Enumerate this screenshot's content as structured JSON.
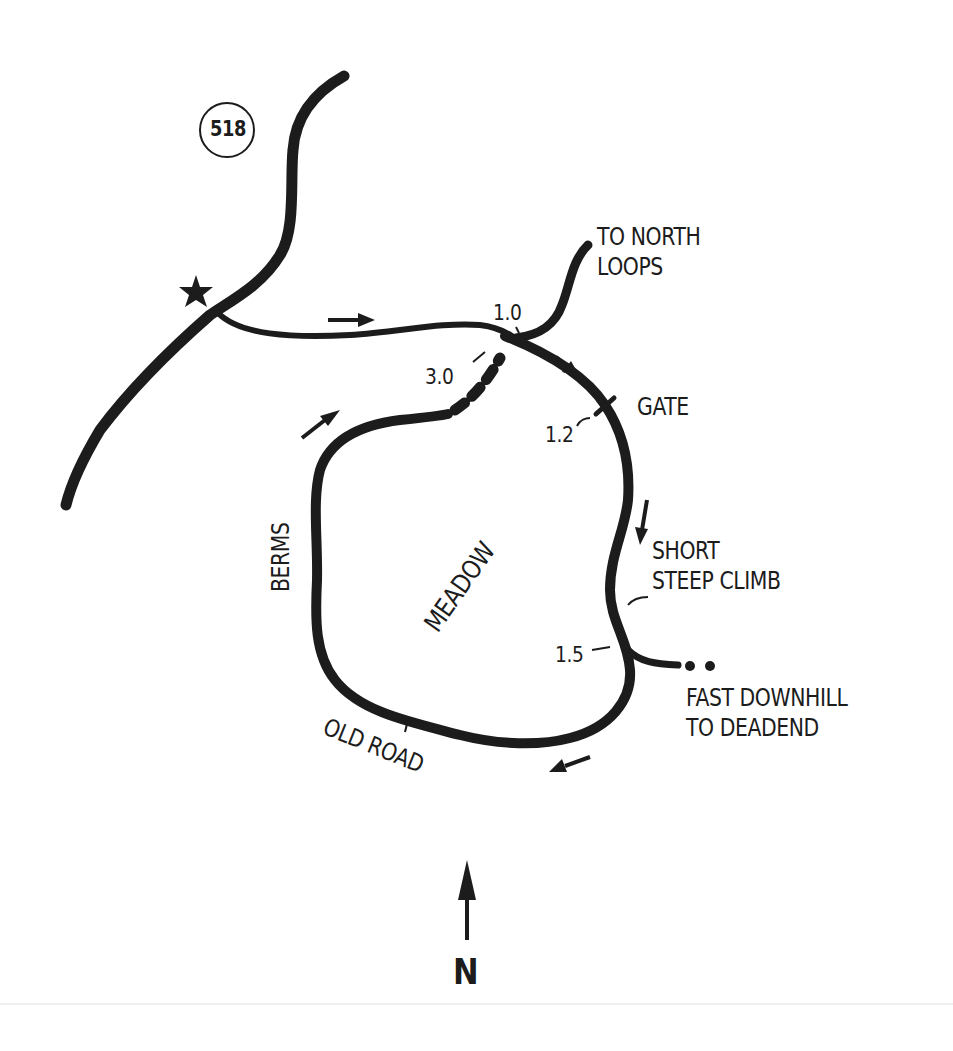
{
  "map": {
    "route_shield": "518",
    "labels": {
      "to_north_loops": "TO NORTH\nLOOPS",
      "gate": "GATE",
      "short_steep_climb": "SHORT\nSTEEP CLIMB",
      "fast_downhill": "FAST DOWNHILL\nTO DEADEND",
      "meadow": "MEADOW",
      "berms": "BERMS",
      "old_road": "OLD ROAD",
      "north": "N"
    },
    "mile_markers": {
      "m1_0": "1.0",
      "m1_2": "1.2",
      "m1_5": "1.5",
      "m3_0": "3.0"
    },
    "colors": {
      "ink": "#1c1c1c",
      "paper": "#ffffff"
    }
  }
}
